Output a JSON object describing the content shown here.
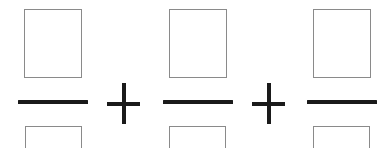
{
  "canvas": {
    "width": 377,
    "height": 148,
    "background_color": "#ffffff",
    "description": "Handwriting-worksheet style arithmetic expression: three blank fractions joined by plus signs"
  },
  "style": {
    "box_border_color": "#8a8a8a",
    "box_fill_color": "#ffffff",
    "bar_color": "#1a1a1a",
    "operator_color": "#1a1a1a",
    "box_border_width": 1,
    "bar_thickness": 4,
    "operator_thickness": 4
  },
  "expression": {
    "notation": "blank-fraction-sum",
    "terms": [
      {
        "type": "fraction",
        "name": "fraction-1",
        "numerator": {
          "value": "",
          "kind": "blank-box",
          "x": 24,
          "y": 9,
          "width": 58,
          "height": 69
        },
        "denominator": {
          "value": "",
          "kind": "blank-box",
          "x": 25,
          "y": 126,
          "width": 57,
          "height": 40,
          "clipped": "bottom"
        },
        "bar": {
          "x": 18,
          "y": 100,
          "width": 70,
          "height": 4
        }
      },
      {
        "type": "fraction",
        "name": "fraction-2",
        "numerator": {
          "value": "",
          "kind": "blank-box",
          "x": 169,
          "y": 9,
          "width": 58,
          "height": 69
        },
        "denominator": {
          "value": "",
          "kind": "blank-box",
          "x": 169,
          "y": 126,
          "width": 57,
          "height": 40,
          "clipped": "bottom"
        },
        "bar": {
          "x": 163,
          "y": 100,
          "width": 70,
          "height": 4
        }
      },
      {
        "type": "fraction",
        "name": "fraction-3",
        "numerator": {
          "value": "",
          "kind": "blank-box",
          "x": 313,
          "y": 9,
          "width": 58,
          "height": 69
        },
        "denominator": {
          "value": "",
          "kind": "blank-box",
          "x": 313,
          "y": 126,
          "width": 57,
          "height": 40,
          "clipped": "bottom"
        },
        "bar": {
          "x": 307,
          "y": 100,
          "width": 70,
          "height": 4,
          "clipped": "right"
        }
      }
    ],
    "operators": [
      {
        "type": "plus",
        "name": "plus-1",
        "glyph": "+",
        "x": 107,
        "y": 83,
        "width": 33,
        "height": 41,
        "center_x": 123,
        "center_y": 103
      },
      {
        "type": "plus",
        "name": "plus-2",
        "glyph": "+",
        "x": 252,
        "y": 83,
        "width": 33,
        "height": 41,
        "center_x": 268,
        "center_y": 103
      }
    ]
  }
}
